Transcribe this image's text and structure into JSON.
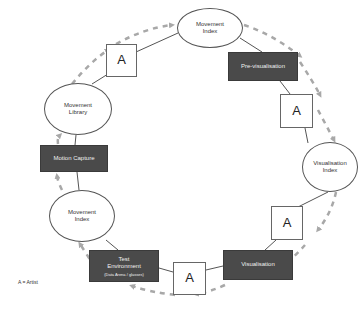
{
  "diagram": {
    "type": "cyclic workflow",
    "colors": {
      "process_box": "#4a4a4a",
      "arrow": "#a8a8a8",
      "connector": "#555555",
      "outline": "#555555"
    },
    "nodes": [
      {
        "id": "movement-index-top",
        "shape": "ellipse",
        "lines": [
          "Movement",
          "Index"
        ]
      },
      {
        "id": "pre-visualisation",
        "shape": "dark-box",
        "lines": [
          "Pre-visualisation"
        ]
      },
      {
        "id": "artist-upper-right",
        "shape": "square",
        "lines": [
          "A"
        ]
      },
      {
        "id": "visualisation-index",
        "shape": "ellipse",
        "lines": [
          "Visualisation",
          "Index"
        ]
      },
      {
        "id": "artist-lower-right",
        "shape": "square",
        "lines": [
          "A"
        ]
      },
      {
        "id": "visualisation",
        "shape": "dark-box",
        "lines": [
          "Visualisation"
        ]
      },
      {
        "id": "artist-bottom",
        "shape": "square",
        "lines": [
          "A"
        ]
      },
      {
        "id": "test-environment",
        "shape": "dark-box",
        "lines": [
          "Test",
          "Environment"
        ],
        "sub": "(Data Arena / glasses)"
      },
      {
        "id": "movement-index-left",
        "shape": "ellipse",
        "lines": [
          "Movement",
          "Index"
        ]
      },
      {
        "id": "motion-capture",
        "shape": "dark-box",
        "lines": [
          "Motion Capture"
        ]
      },
      {
        "id": "movement-library",
        "shape": "ellipse",
        "lines": [
          "Movement",
          "Library"
        ]
      },
      {
        "id": "artist-top-left",
        "shape": "square",
        "lines": [
          "A"
        ]
      }
    ],
    "legend": "A = Artist",
    "flow_direction": "clockwise"
  }
}
